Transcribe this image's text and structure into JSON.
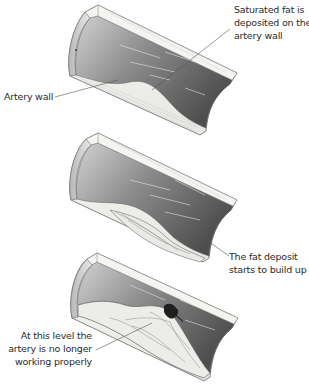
{
  "diagram": {
    "stages": [
      {
        "id": "stage-1",
        "labels": [
          {
            "name": "artery-wall-label",
            "lines": [
              "Artery wall"
            ]
          },
          {
            "name": "saturated-fat-label",
            "lines": [
              "Saturated fat is",
              "deposited on the",
              "artery wall"
            ]
          }
        ]
      },
      {
        "id": "stage-2",
        "labels": [
          {
            "name": "fat-deposit-label",
            "lines": [
              "The fat deposit",
              "starts to build up"
            ]
          }
        ]
      },
      {
        "id": "stage-3",
        "labels": [
          {
            "name": "artery-blocked-label",
            "lines": [
              "At this level the",
              "artery is no longer",
              "working properly"
            ]
          }
        ]
      }
    ],
    "colors": {
      "lumen_dark": "#5e5e5e",
      "lumen_light": "#c9c9c9",
      "wall": "#f2f2ef",
      "outline": "#6a6a6a",
      "leader_line": "#555555",
      "clot": "#1e1e1e"
    }
  }
}
